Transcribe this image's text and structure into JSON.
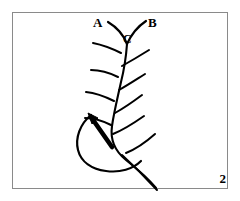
{
  "figure": {
    "number": "2",
    "caption_labels": {
      "a": "A",
      "b": "B",
      "c": "C"
    },
    "background_color": "#ffffff",
    "ink_color": "#000000",
    "frame_color": "#8a8a8a"
  },
  "diagram_data": {
    "type": "line-drawing",
    "subject": "compound-leaf-frond",
    "frame": {
      "x": 12,
      "y": 12,
      "width": 216,
      "height": 177
    },
    "rachis": {
      "name": "central-axis",
      "path": "M 127 44 C 126 58, 124 70, 121 82 C 118 96, 114 112, 112 126 C 110 140, 116 152, 126 160 C 136 168, 148 178, 156 188",
      "stroke_width": 2.1
    },
    "pinnae": [
      {
        "name": "pinna-a-upper-left",
        "label": "A",
        "path": "M 127 44 C 124 36, 118 28, 108 22",
        "stroke_width": 2.2
      },
      {
        "name": "pinna-b-upper-right",
        "label": "B",
        "path": "M 127 44 C 131 35, 137 27, 146 21",
        "stroke_width": 2.2
      },
      {
        "name": "pinna-left-2",
        "path": "M 121 53 C 113 49, 103 45, 93 43",
        "stroke_width": 2.0
      },
      {
        "name": "pinna-right-2",
        "path": "M 122 66 C 131 61, 141 55, 149 50",
        "stroke_width": 2.0
      },
      {
        "name": "pinna-left-3",
        "path": "M 118 77 C 110 73, 100 70, 91 70",
        "stroke_width": 2.0
      },
      {
        "name": "pinna-right-3",
        "path": "M 119 90 C 128 85, 137 79, 145 74",
        "stroke_width": 2.0
      },
      {
        "name": "pinna-left-4",
        "path": "M 114 101 C 106 97, 96 93, 86 92",
        "stroke_width": 2.0
      },
      {
        "name": "pinna-right-4",
        "path": "M 115 113 C 124 108, 134 101, 142 95",
        "stroke_width": 2.0
      },
      {
        "name": "pinna-left-5",
        "path": "M 111 125 C 103 121, 94 118, 85 118",
        "stroke_width": 2.0
      },
      {
        "name": "pinna-right-5",
        "path": "M 113 134 C 123 130, 134 123, 144 116",
        "stroke_width": 2.0
      },
      {
        "name": "pinna-right-6",
        "path": "M 126 153 C 136 149, 146 142, 155 134",
        "stroke_width": 2.0
      }
    ],
    "leaf_blade": {
      "name": "blade-outline",
      "path": "M 91 115 C 80 124, 75 138, 78 150 C 81 162, 92 169, 106 171 C 120 173, 133 169, 141 161",
      "stroke_width": 2.2
    },
    "arrow": {
      "name": "direction-arrow",
      "points_toward": "upper-left",
      "shaft_path": "M 112 147 L 91 117",
      "shaft_width": 4.6,
      "head_path": "M 88 113 L 97 117 L 92 123 Z"
    },
    "terminal_stem": {
      "name": "terminal-stem",
      "path": "M 122 155 C 133 165, 146 178, 157 190",
      "stroke_width": 2.0
    }
  }
}
